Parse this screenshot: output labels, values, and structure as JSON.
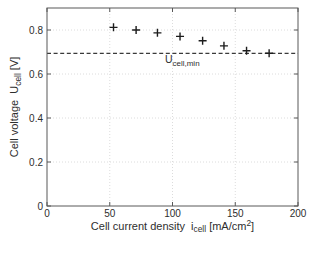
{
  "chart_data": {
    "type": "scatter",
    "title": "",
    "xlabel_parts": [
      {
        "t": "Cell current density  i",
        "s": "n"
      },
      {
        "t": "cell",
        "s": "sub"
      },
      {
        "t": " [mA/cm",
        "s": "n"
      },
      {
        "t": "2",
        "s": "sup"
      },
      {
        "t": "]",
        "s": "n"
      }
    ],
    "ylabel_parts": [
      {
        "t": "Cell voltage  U",
        "s": "n"
      },
      {
        "t": "cell",
        "s": "sub"
      },
      {
        "t": " [V]",
        "s": "n"
      }
    ],
    "xlim": [
      0,
      200
    ],
    "ylim": [
      0,
      0.9
    ],
    "xticks": [
      0,
      50,
      100,
      150,
      200
    ],
    "yticks": [
      0,
      0.2,
      0.4,
      0.6,
      0.8
    ],
    "xtick_labels": [
      "0",
      "50",
      "100",
      "150",
      "200"
    ],
    "ytick_labels": [
      "0",
      "0.2",
      "0.4",
      "0.6",
      "0.8"
    ],
    "grid": true,
    "legend": false,
    "series": [
      {
        "marker": "+",
        "x": [
          53,
          71,
          88,
          106,
          124,
          141,
          159,
          177
        ],
        "y": [
          0.812,
          0.8,
          0.787,
          0.771,
          0.751,
          0.728,
          0.706,
          0.694
        ]
      }
    ],
    "reference_line": {
      "y": 0.694,
      "style": "dashed",
      "label_parts": [
        {
          "t": "U",
          "s": "n"
        },
        {
          "t": "cell,min",
          "s": "sub"
        }
      ],
      "label_at_x": 94
    },
    "colors": {
      "background": "#ffffff",
      "axis": "#585858",
      "grid": "#dcdcdc",
      "text": "#2e2e2e",
      "marker": "#1c1c1c",
      "ref_line": "#3a3a3a"
    }
  }
}
